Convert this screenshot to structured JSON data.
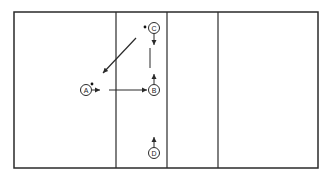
{
  "diagram": {
    "type": "court-play-diagram",
    "colors": {
      "line": "#2a2a2a",
      "background": "#ffffff"
    },
    "court": {
      "outer": {
        "x": 14,
        "y": 12,
        "width": 304,
        "height": 156
      },
      "dividers_x": [
        116,
        167,
        218
      ]
    },
    "players": [
      {
        "id": "A",
        "label": "A",
        "cx": 86,
        "cy": 90,
        "ball": true
      },
      {
        "id": "B",
        "label": "B",
        "cx": 154,
        "cy": 90,
        "ball": false
      },
      {
        "id": "C",
        "label": "C",
        "cx": 154,
        "cy": 28,
        "ball": true
      },
      {
        "id": "D",
        "label": "D",
        "cx": 154,
        "cy": 153,
        "ball": false
      }
    ],
    "arrows": [
      {
        "from": "A",
        "to": "short-right",
        "description": "A short move right"
      },
      {
        "from": "A-area",
        "to": "B",
        "description": "pass/run toward B"
      },
      {
        "from": "C",
        "to": "A-area",
        "description": "diagonal from near C toward A"
      },
      {
        "from": "C",
        "to": "down",
        "description": "C short move down"
      },
      {
        "from": "B",
        "to": "up",
        "description": "B short move up"
      },
      {
        "from": "D",
        "to": "up",
        "description": "D short move up"
      }
    ]
  }
}
